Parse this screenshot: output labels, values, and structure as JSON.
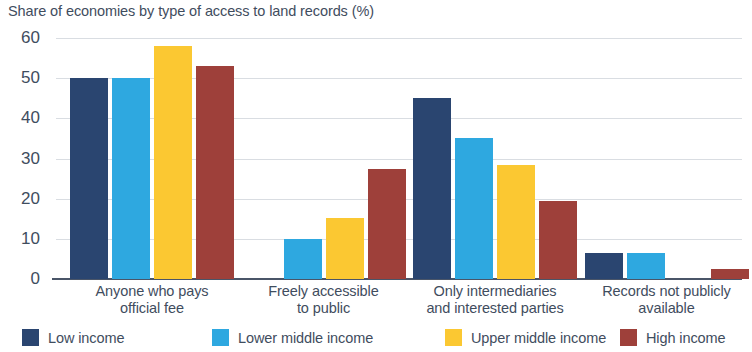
{
  "chart_data": {
    "type": "bar",
    "title": "Share of economies by type of access to land records (%)",
    "xlabel": "",
    "ylabel": "",
    "ylim": [
      0,
      60
    ],
    "yticks": [
      0,
      10,
      20,
      30,
      40,
      50,
      60
    ],
    "ytick_labels": [
      "0",
      "10",
      "20",
      "30",
      "40",
      "50",
      "60"
    ],
    "grid": true,
    "legend_position": "bottom",
    "categories": [
      "Anyone who pays official fee",
      "Freely accessible to public",
      "Only intermediaries and interested parties",
      "Records not publicly available"
    ],
    "category_lines": [
      [
        "Anyone who pays",
        "official fee"
      ],
      [
        "Freely accessible",
        "to public"
      ],
      [
        "Only intermediaries",
        "and interested parties"
      ],
      [
        "Records not publicly",
        "available"
      ]
    ],
    "series": [
      {
        "name": "Low income",
        "color": "#2a4570",
        "values": [
          50,
          0,
          45,
          6.5
        ]
      },
      {
        "name": "Lower middle income",
        "color": "#2ea8e0",
        "values": [
          50,
          10,
          35,
          6.5
        ]
      },
      {
        "name": "Upper middle income",
        "color": "#fbc832",
        "values": [
          58,
          15.3,
          28.5,
          0
        ]
      },
      {
        "name": "High income",
        "color": "#9e403a",
        "values": [
          53,
          27.5,
          19.5,
          2.5
        ]
      }
    ]
  }
}
